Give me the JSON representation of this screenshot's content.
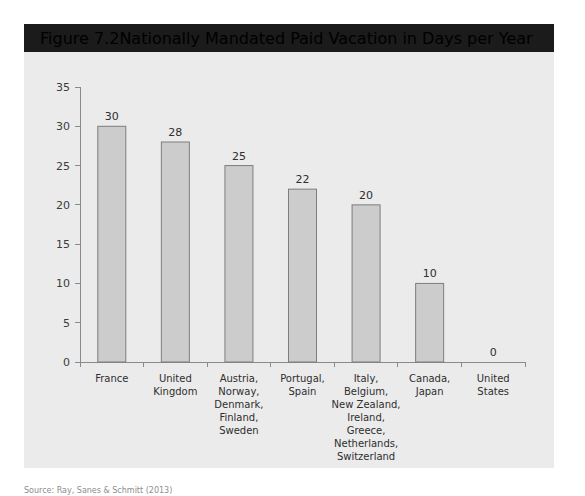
{
  "header": {
    "figure_number": "Figure 7.2",
    "title": "Nationally Mandated Paid Vacation in Days per Year"
  },
  "source_note": "Source: Ray, Sanes & Schmitt (2013)",
  "colors": {
    "header_bar": "#1b1b1b",
    "header_text": "#ffffff",
    "panel_background": "#ebebeb",
    "bar_fill": "#cccccc",
    "bar_border": "#7d7d7d",
    "axis": "#8a8a8a",
    "label_text": "#2e2e2e"
  },
  "chart_data": {
    "type": "bar",
    "title": "Nationally Mandated Paid Vacation in Days per Year",
    "xlabel": "",
    "ylabel": "",
    "ylim": [
      0,
      35
    ],
    "yticks": [
      0,
      5,
      10,
      15,
      20,
      25,
      30,
      35
    ],
    "ytick_labels": [
      "0",
      "5",
      "10",
      "15",
      "20",
      "25",
      "30",
      "35"
    ],
    "grid": false,
    "legend": "none",
    "categories": [
      "France",
      "United\nKingdom",
      "Austria,\nNorway,\nDenmark,\nFinland,\nSweden",
      "Portugal,\nSpain",
      "Italy,\nBelgium,\nNew Zealand,\nIreland,\nGreece,\nNetherlands,\nSwitzerland",
      "Canada,\nJapan",
      "United\nStates"
    ],
    "category_lines": [
      [
        "France"
      ],
      [
        "United",
        "Kingdom"
      ],
      [
        "Austria,",
        "Norway,",
        "Denmark,",
        "Finland,",
        "Sweden"
      ],
      [
        "Portugal,",
        "Spain"
      ],
      [
        "Italy,",
        "Belgium,",
        "New Zealand,",
        "Ireland,",
        "Greece,",
        "Netherlands,",
        "Switzerland"
      ],
      [
        "Canada,",
        "Japan"
      ],
      [
        "United",
        "States"
      ]
    ],
    "values": [
      30,
      28,
      25,
      22,
      20,
      10,
      0
    ],
    "value_labels": [
      "30",
      "28",
      "25",
      "22",
      "20",
      "10",
      "0"
    ]
  }
}
